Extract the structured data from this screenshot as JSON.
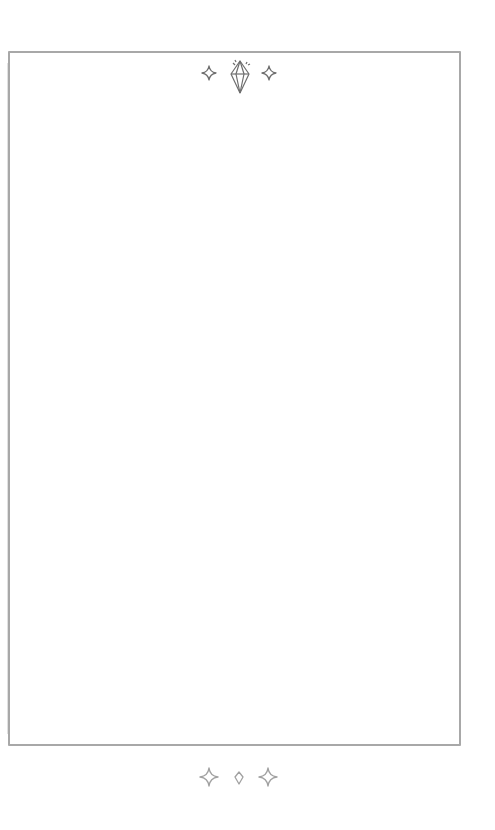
{
  "page": {
    "background": "#ffffff",
    "frame_color": "#a8a8a8",
    "ink_color": "#7a7a7a"
  },
  "header_ornament": {
    "icons": [
      "sparkle-icon",
      "diamond-gem-icon",
      "sparkle-icon"
    ]
  },
  "footer_ornament": {
    "icons": [
      "sparkle-icon",
      "small-diamond-icon",
      "sparkle-icon"
    ]
  },
  "content": {
    "text": ""
  }
}
